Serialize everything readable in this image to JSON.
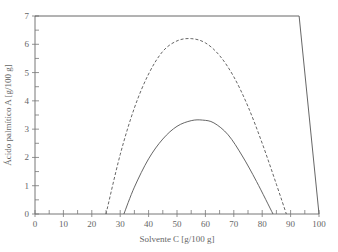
{
  "chart_data": {
    "type": "line",
    "title": "",
    "xlabel": "Solvente C [g/100  g]",
    "ylabel": "Ácido palmítico A [g/100  g]",
    "xlim": [
      0,
      100
    ],
    "ylim": [
      0,
      7
    ],
    "xticks": [
      0,
      10,
      20,
      30,
      40,
      50,
      60,
      70,
      80,
      90,
      100
    ],
    "yticks": [
      0,
      1,
      2,
      3,
      4,
      5,
      6,
      7
    ],
    "xminor_step": 5,
    "yminor_step": 0.5,
    "grid": false,
    "legend": null,
    "series": [
      {
        "name": "boundary",
        "style": "solid",
        "x": [
          0,
          93,
          100
        ],
        "y": [
          7,
          7,
          0
        ]
      },
      {
        "name": "dashed-curve",
        "style": "dashed",
        "x": [
          25,
          30,
          35,
          40,
          45,
          50,
          55,
          60,
          65,
          70,
          75,
          80,
          85,
          88.5
        ],
        "y": [
          0,
          2.1,
          3.75,
          4.95,
          5.75,
          6.12,
          6.2,
          6.05,
          5.6,
          4.85,
          3.8,
          2.5,
          1.05,
          0
        ]
      },
      {
        "name": "solid-curve",
        "style": "solid",
        "x": [
          31.3,
          35,
          40,
          45,
          50,
          55,
          59,
          63,
          68,
          73,
          78,
          83.8
        ],
        "y": [
          0,
          0.95,
          1.95,
          2.65,
          3.1,
          3.3,
          3.32,
          3.22,
          2.8,
          2.05,
          1.15,
          0
        ]
      }
    ]
  }
}
